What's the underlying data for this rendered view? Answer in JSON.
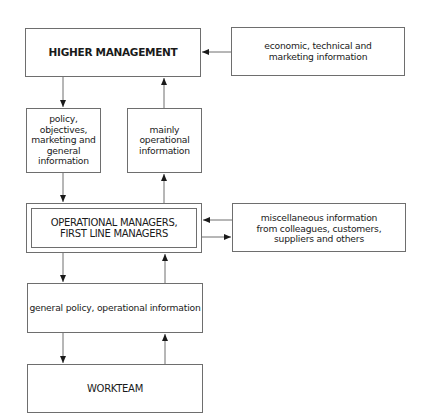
{
  "diagram": {
    "type": "flow",
    "nodes": {
      "higher_management": {
        "label": "HIGHER MANAGEMENT"
      },
      "external_info": {
        "label": "economic, technical and\nmarketing information"
      },
      "policy_down": {
        "label": "policy,\nobjectives,\nmarketing and\ngeneral\ninformation"
      },
      "operational_up": {
        "label": "mainly\noperational\ninformation"
      },
      "operational_managers": {
        "label": "OPERATIONAL MANAGERS,\nFIRST LINE MANAGERS"
      },
      "misc_info": {
        "label": "miscellaneous information\nfrom colleagues, customers,\nsuppliers and others"
      },
      "general_policy": {
        "label": "general policy, operational information"
      },
      "workteam": {
        "label": "WORKTEAM"
      }
    },
    "edges": [
      {
        "from": "external_info",
        "to": "higher_management"
      },
      {
        "from": "higher_management",
        "to": "policy_down"
      },
      {
        "from": "policy_down",
        "to": "operational_managers"
      },
      {
        "from": "operational_managers",
        "to": "operational_up"
      },
      {
        "from": "operational_up",
        "to": "higher_management"
      },
      {
        "from": "misc_info",
        "to": "operational_managers"
      },
      {
        "from": "operational_managers",
        "to": "misc_info"
      },
      {
        "from": "operational_managers",
        "to": "general_policy"
      },
      {
        "from": "general_policy",
        "to": "workteam"
      },
      {
        "from": "workteam",
        "to": "general_policy"
      },
      {
        "from": "general_policy",
        "to": "operational_managers"
      }
    ],
    "colors": {
      "line": "#6e6e6e",
      "arrow": "#1a1a1a",
      "text": "#1a1a1a"
    }
  }
}
